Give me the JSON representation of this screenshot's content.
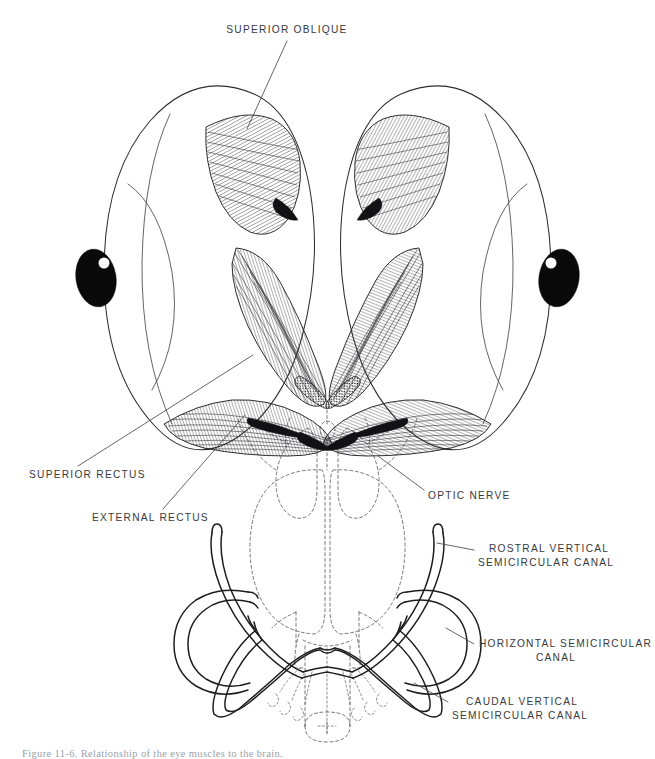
{
  "figure": {
    "type": "anatomical-line-diagram",
    "background_color": "#ffffff",
    "ink_color": "#2e2e30",
    "label_color": "#3a3a3c",
    "caption": "Figure 11-6.  Relationship of the eye muscles to the brain.",
    "labels": [
      {
        "id": "superior-oblique",
        "text": "SUPERIOR OBLIQUE",
        "lines": [
          "SUPERIOR OBLIQUE"
        ],
        "align": "middle",
        "x": 287,
        "y": 33
      },
      {
        "id": "superior-rectus",
        "text": "SUPERIOR RECTUS",
        "lines": [
          "SUPERIOR RECTUS"
        ],
        "align": "start",
        "x": 29,
        "y": 478
      },
      {
        "id": "external-rectus",
        "text": "EXTERNAL RECTUS",
        "lines": [
          "EXTERNAL RECTUS"
        ],
        "align": "start",
        "x": 92,
        "y": 521
      },
      {
        "id": "optic-nerve",
        "text": "OPTIC NERVE",
        "lines": [
          "OPTIC NERVE"
        ],
        "align": "start",
        "x": 428,
        "y": 499
      },
      {
        "id": "rostral-vertical-semicircular-canal",
        "text": "ROSTRAL VERTICAL SEMICIRCULAR CANAL",
        "lines": [
          "ROSTRAL VERTICAL",
          "SEMICIRCULAR CANAL"
        ],
        "align": "start",
        "x": 478,
        "y": 552
      },
      {
        "id": "horizontal-semicircular-canal",
        "text": "HORIZONTAL SEMICIRCULAR CANAL",
        "lines": [
          "HORIZONTAL SEMICIRCULAR",
          "CANAL"
        ],
        "align": "start",
        "x": 479,
        "y": 647
      },
      {
        "id": "caudal-vertical-semicircular-canal",
        "text": "CAUDAL VERTICAL SEMICIRCULAR CANAL",
        "lines": [
          "CAUDAL VERTICAL",
          "SEMICIRCULAR CANAL"
        ],
        "align": "start",
        "x": 452,
        "y": 705
      }
    ],
    "structures": [
      {
        "id": "left-eyeball",
        "name": "left eyeball"
      },
      {
        "id": "right-eyeball",
        "name": "right eyeball"
      },
      {
        "id": "left-pupil",
        "name": "left pupil"
      },
      {
        "id": "right-pupil",
        "name": "right pupil"
      },
      {
        "id": "brain",
        "name": "brain (dashed outline)"
      },
      {
        "id": "semicircular-canal-system",
        "name": "semicircular canal system"
      }
    ]
  }
}
